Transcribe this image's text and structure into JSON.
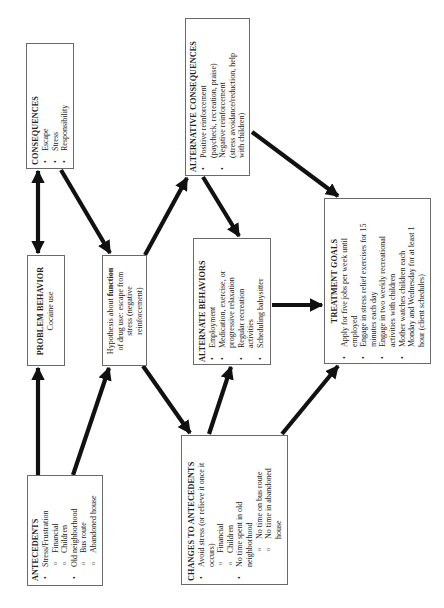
{
  "diagram": {
    "orientation": "rotated-90-ccw",
    "boxes": {
      "consequences": {
        "title": "CONSEQUENCES",
        "items": [
          "Escape",
          "Stress",
          "Responsibility"
        ]
      },
      "problem_behavior": {
        "title": "PROBLEM BEHAVIOR",
        "text": "Cocaine use"
      },
      "antecedents": {
        "title": "ANTECEDENTS",
        "items": [
          {
            "level": 1,
            "text": "Stress/Frustration"
          },
          {
            "level": 2,
            "text": "Financial"
          },
          {
            "level": 2,
            "text": "Children"
          },
          {
            "level": 1,
            "text": "Old neighborhood"
          },
          {
            "level": 2,
            "text": "Bus route"
          },
          {
            "level": 2,
            "text": "Abandoned house"
          }
        ]
      },
      "hypothesis": {
        "line1_pre": "Hypothesis about ",
        "line1_bold": "function",
        "line2": "of drug use: escape from",
        "line3": "stress (negative",
        "line4": "reinforcement)"
      },
      "alternative_consequences": {
        "title": "ALTERNATIVE CONSEQUENCES",
        "items": [
          {
            "line1": "Positive reinforcement",
            "line2": "(paycheck, recreation, praise)"
          },
          {
            "line1": "Negative reinforcement",
            "line2": "(stress avoidance/reduction, help",
            "line3": "with children)"
          }
        ]
      },
      "alternate_behaviors": {
        "title": "ALTERNATE BEHAVIORS",
        "items": [
          {
            "line1": "Employment"
          },
          {
            "line1": "Medication, exercise, or",
            "line2": "progressive relaxation"
          },
          {
            "line1": "Regular recreation",
            "line2": "activities"
          },
          {
            "line1": "Scheduling babysitter"
          }
        ]
      },
      "changes_to_antecedents": {
        "title": "CHANGES TO ANTECEDENTS",
        "items": [
          {
            "level": 1,
            "line1": "Avoid stress (or relieve it once it",
            "line2": "occurs)"
          },
          {
            "level": 2,
            "line1": "Financial"
          },
          {
            "level": 2,
            "line1": "Children"
          },
          {
            "level": 1,
            "line1": "No time spent in old",
            "line2": "neighborhood"
          },
          {
            "level": 3,
            "line1": "No time on bus route"
          },
          {
            "level": 3,
            "line1": "No time in abandoned",
            "line2": "house"
          }
        ]
      },
      "treatment_goals": {
        "title": "TREATMENT GOALS",
        "items": [
          {
            "line1": "Apply for five jobs per week until",
            "line2": "employed"
          },
          {
            "line1": "Engage in stress relief exercises for 15",
            "line2": "minutes each day"
          },
          {
            "line1": "Engage in two weekly recreational",
            "line2": "activities with children"
          },
          {
            "line1": "Mother watches children each",
            "line2": "Monday and Wednesday for at least 1",
            "line3": "hour (client schedules)"
          }
        ]
      }
    },
    "arrows": [
      {
        "from": "problem_behavior",
        "to": "consequences",
        "bidirectional": true
      },
      {
        "from": "consequences",
        "to": "hypothesis"
      },
      {
        "from": "antecedents",
        "to": "problem_behavior"
      },
      {
        "from": "antecedents",
        "to": "hypothesis"
      },
      {
        "from": "hypothesis",
        "to": "alternative_consequences"
      },
      {
        "from": "hypothesis",
        "to": "changes_to_antecedents"
      },
      {
        "from": "alternative_consequences",
        "to": "alternate_behaviors"
      },
      {
        "from": "alternative_consequences",
        "to": "treatment_goals"
      },
      {
        "from": "changes_to_antecedents",
        "to": "alternate_behaviors"
      },
      {
        "from": "changes_to_antecedents",
        "to": "treatment_goals"
      },
      {
        "from": "alternate_behaviors",
        "to": "treatment_goals"
      }
    ],
    "colors": {
      "line": "#111111",
      "border": "#6a6a6a",
      "background": "#ffffff"
    }
  }
}
